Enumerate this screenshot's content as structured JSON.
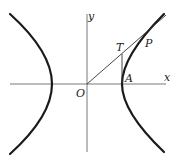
{
  "diagram": {
    "type": "hyperbola-construction",
    "labels": {
      "origin": "O",
      "x_axis": "x",
      "y_axis": "y",
      "point_T": "T",
      "point_P": "P",
      "point_A": "A"
    },
    "colors": {
      "background": "#ffffff",
      "curve": "#1a1a1a",
      "axes": "#555555",
      "lines": "#333333"
    }
  }
}
